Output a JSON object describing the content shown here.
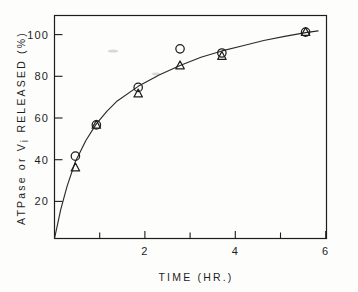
{
  "chart_data": {
    "type": "scatter",
    "title": "",
    "xlabel": "TIME (HR.)",
    "ylabel": "ATPase or Vi RELEASED (%)",
    "ylabel_main": "ATPase  or  V",
    "ylabel_subscript": "i",
    "ylabel_tail": "  RELEASED  (%)",
    "xlim": [
      0,
      6.5
    ],
    "ylim": [
      0,
      107
    ],
    "grid": false,
    "legend": "none",
    "x_tick_values": [
      1,
      2,
      3,
      4,
      5,
      6
    ],
    "x_tick_labels": [
      "",
      "2",
      "",
      "4",
      "",
      "6"
    ],
    "y_tick_values": [
      20,
      40,
      60,
      80,
      100
    ],
    "y_tick_labels": [
      "20",
      "40",
      "60",
      "80",
      "100"
    ],
    "series": [
      {
        "name": "ATPase released",
        "marker": "circle",
        "x": [
          0.5,
          1.0,
          2.0,
          3.0,
          4.0,
          6.0
        ],
        "values": [
          39.5,
          54.5,
          72.5,
          91.0,
          89.0,
          99.0
        ]
      },
      {
        "name": "Vi released",
        "marker": "triangle",
        "x": [
          0.5,
          1.0,
          2.0,
          3.0,
          4.0,
          6.0
        ],
        "values": [
          34.0,
          54.5,
          69.5,
          83.0,
          87.5,
          99.0
        ]
      }
    ],
    "fitted_curve": {
      "name": "fitted release curve",
      "x": [
        0.0,
        0.15,
        0.3,
        0.5,
        0.75,
        1.0,
        1.25,
        1.5,
        2.0,
        2.5,
        3.0,
        3.5,
        4.0,
        4.5,
        5.0,
        5.5,
        6.0,
        6.3
      ],
      "values": [
        0.0,
        14.0,
        25.0,
        37.0,
        47.0,
        55.0,
        61.0,
        66.0,
        73.0,
        78.5,
        83.0,
        87.0,
        90.0,
        92.5,
        95.0,
        97.0,
        98.8,
        99.6
      ]
    }
  }
}
